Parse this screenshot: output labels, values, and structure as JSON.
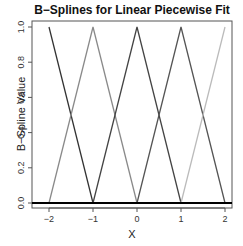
{
  "chart_data": {
    "type": "line",
    "title": "B−Splines for Linear Piecewise Fit",
    "xlabel": "X",
    "ylabel": "B−Spline Value",
    "xlim": [
      -2.05,
      2.05
    ],
    "ylim": [
      -0.03,
      1.03
    ],
    "xticks": [
      -2,
      -1,
      0,
      1,
      2
    ],
    "xtick_labels": [
      "−2",
      "−1",
      "0",
      "1",
      "2"
    ],
    "yticks": [
      0.0,
      0.2,
      0.4,
      0.6,
      0.8,
      1.0
    ],
    "ytick_labels": [
      "0.0",
      "0.2",
      "0.4",
      "0.6",
      "0.8",
      "1.0"
    ],
    "grid": false,
    "legend": null,
    "series": [
      {
        "name": "B1",
        "color": "#333333",
        "x": [
          -2,
          -1
        ],
        "y": [
          1,
          0
        ]
      },
      {
        "name": "B2",
        "color": "#8a8a8a",
        "x": [
          -2,
          -1,
          0
        ],
        "y": [
          0,
          1,
          0
        ]
      },
      {
        "name": "B3",
        "color": "#444444",
        "x": [
          -1,
          0,
          1
        ],
        "y": [
          0,
          1,
          0
        ]
      },
      {
        "name": "B4",
        "color": "#555555",
        "x": [
          0,
          1,
          2
        ],
        "y": [
          0,
          1,
          0
        ]
      },
      {
        "name": "B5",
        "color": "#bbbbbb",
        "x": [
          1,
          2
        ],
        "y": [
          0,
          1
        ]
      }
    ],
    "hline": {
      "y": 0,
      "color": "#000000",
      "width": 2
    }
  }
}
